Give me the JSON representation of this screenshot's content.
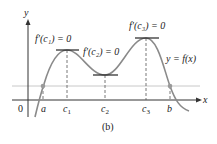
{
  "figure": {
    "caption": "(b)",
    "axes": {
      "x_label": "x",
      "y_label": "y",
      "origin_label": "0"
    },
    "x_ticks": [
      {
        "id": "a",
        "label": "a"
      },
      {
        "id": "c1",
        "label": "c",
        "sub": "1"
      },
      {
        "id": "c2",
        "label": "c",
        "sub": "2"
      },
      {
        "id": "c3",
        "label": "c",
        "sub": "3"
      },
      {
        "id": "b",
        "label": "b"
      }
    ],
    "annotations": {
      "c1": "f′(c₁) = 0",
      "c2": "f′(c₂) = 0",
      "c3": "f′(c₃) = 0",
      "curve": "y = f(x)"
    },
    "colors": {
      "curve": "#8a8a8a",
      "axis": "#333333",
      "reference_line": "#c8c8c8",
      "tangent": "#222222",
      "dot": "#9a9a9a"
    }
  }
}
